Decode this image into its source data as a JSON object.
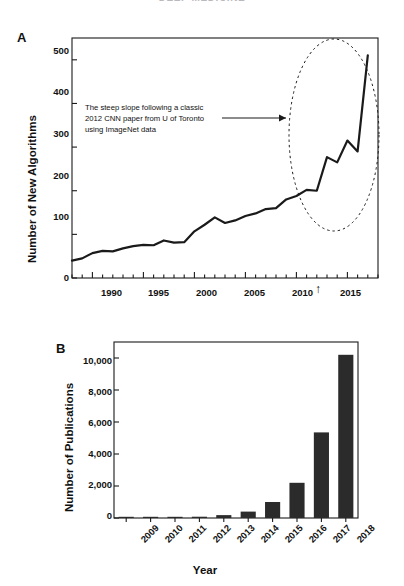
{
  "figure": {
    "cut_title": "DEEP MEDICINE",
    "background_color": "#ffffff",
    "ink_color": "#1a1a1a"
  },
  "panels": [
    {
      "id": "A",
      "label": "A",
      "annotation_lines": [
        "The steep slope following a classic",
        "2012 CNN paper from U of Toronto",
        "using ImageNet data"
      ],
      "highlight_marker": "up-arrow at 2012",
      "arrow_glyph": "↑"
    },
    {
      "id": "B",
      "label": "B"
    }
  ],
  "chart_data": [
    {
      "type": "line",
      "panel": "A",
      "title": "",
      "xlabel": "",
      "ylabel": "Number of New Algorithms",
      "xlim": [
        1988,
        2018
      ],
      "ylim": [
        0,
        550
      ],
      "yticks": [
        0,
        100,
        200,
        300,
        400,
        500
      ],
      "ytick_labels": [
        "0",
        "100",
        "200",
        "300",
        "400",
        "500"
      ],
      "xticks": [
        1990,
        1995,
        2000,
        2005,
        2010,
        2015
      ],
      "xtick_labels": [
        "1990",
        "1995",
        "2000",
        "2005",
        "2010",
        "2015"
      ],
      "minor_xtick_interval": 1,
      "grid": false,
      "legend": "none",
      "line_color": "#1a1a1a",
      "line_width_px": 2.2,
      "x": [
        1988,
        1989,
        1990,
        1991,
        1992,
        1993,
        1994,
        1995,
        1996,
        1997,
        1998,
        1999,
        2000,
        2001,
        2002,
        2003,
        2004,
        2005,
        2006,
        2007,
        2008,
        2009,
        2010,
        2011,
        2012,
        2013,
        2014,
        2015,
        2016,
        2017
      ],
      "values": [
        40,
        45,
        57,
        62,
        61,
        68,
        73,
        76,
        75,
        86,
        81,
        82,
        107,
        122,
        139,
        126,
        132,
        142,
        148,
        158,
        160,
        180,
        188,
        202,
        200,
        277,
        265,
        315,
        290,
        510
      ],
      "annotations": [
        {
          "text": "The steep slope following a classic 2012 CNN paper from U of Toronto using ImageNet data",
          "shape": "arrow-pointing-right"
        },
        {
          "text": "",
          "shape": "dashed-ellipse-around-2011-to-2017"
        }
      ]
    },
    {
      "type": "bar",
      "panel": "B",
      "title": "",
      "xlabel": "Year",
      "ylabel": "Number of Publications",
      "categories": [
        "2009",
        "2010",
        "2011",
        "2012",
        "2013",
        "2014",
        "2015",
        "2016",
        "2017",
        "2018"
      ],
      "values": [
        20,
        40,
        55,
        80,
        180,
        400,
        1000,
        2200,
        5350,
        10200
      ],
      "ylim": [
        0,
        11000
      ],
      "yticks": [
        0,
        2000,
        4000,
        6000,
        8000,
        10000
      ],
      "ytick_labels": [
        "0",
        "2,000",
        "4,000",
        "6,000",
        "8,000",
        "10,000"
      ],
      "grid": false,
      "legend": "none",
      "bar_color": "#2b2b2b"
    }
  ]
}
